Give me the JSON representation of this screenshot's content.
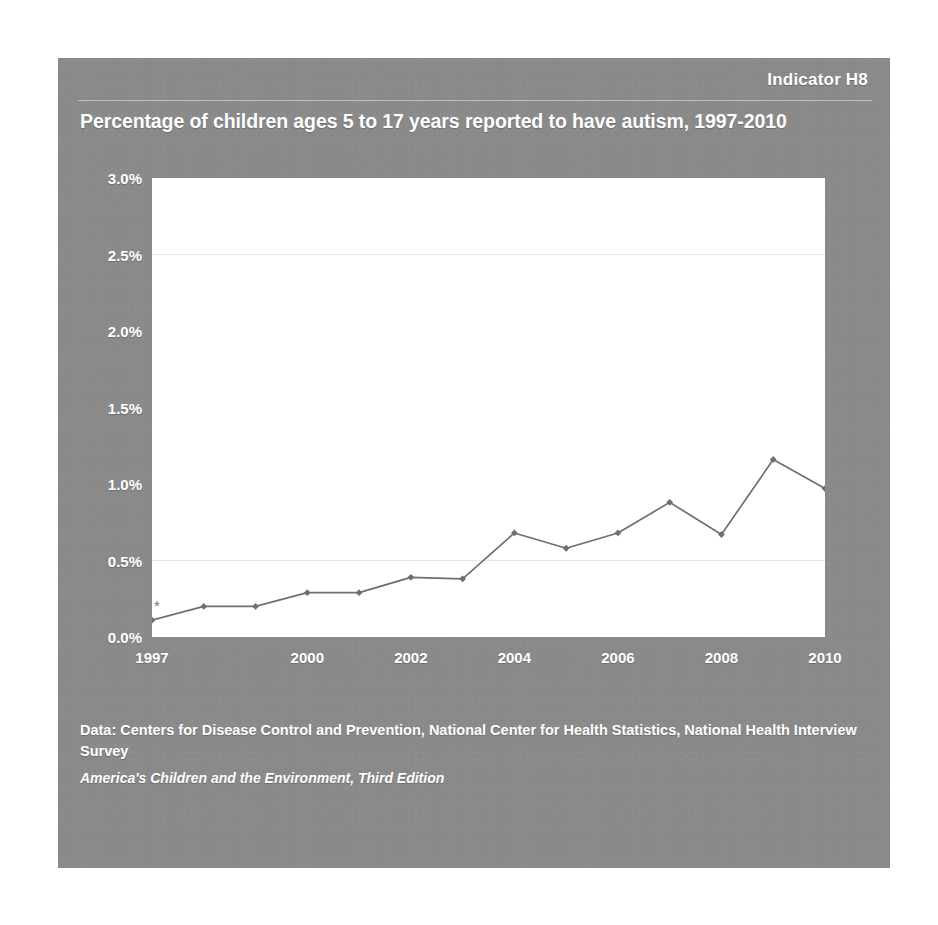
{
  "card": {
    "indicator_label": "Indicator H8",
    "background_color": "#8a8a8a",
    "text_color": "#ffffff"
  },
  "footer": {
    "source_line": "Data: Centers for Disease Control and Prevention, National Center for Health Statistics, National Health Interview Survey",
    "publication": "America's Children and the Environment, Third Edition"
  },
  "chart_data": {
    "type": "line",
    "title": "Percentage of children ages 5 to 17 years reported to have autism, 1997-2010",
    "xlabel": "",
    "ylabel": "",
    "x": [
      1997,
      1998,
      1999,
      2000,
      2001,
      2002,
      2003,
      2004,
      2005,
      2006,
      2007,
      2008,
      2009,
      2010
    ],
    "values": [
      0.11,
      0.2,
      0.2,
      0.29,
      0.29,
      0.39,
      0.38,
      0.68,
      0.58,
      0.68,
      0.88,
      0.67,
      1.16,
      0.97
    ],
    "series": [
      {
        "name": "Percentage of children ages 5 to 17 years reported to have autism",
        "values": [
          0.11,
          0.2,
          0.2,
          0.29,
          0.29,
          0.39,
          0.38,
          0.68,
          0.58,
          0.68,
          0.88,
          0.67,
          1.16,
          0.97
        ]
      }
    ],
    "xlim": [
      1997,
      2010
    ],
    "ylim": [
      0.0,
      3.0
    ],
    "ytick_values": [
      0.0,
      0.5,
      1.0,
      1.5,
      2.0,
      2.5,
      3.0
    ],
    "ytick_labels": [
      "0.0%",
      "0.5%",
      "1.0%",
      "1.5%",
      "2.0%",
      "2.5%",
      "3.0%"
    ],
    "xtick_values": [
      1997,
      2000,
      2002,
      2004,
      2006,
      2008,
      2010
    ],
    "xtick_labels": [
      "1997",
      "2000",
      "2002",
      "2004",
      "2006",
      "2008",
      "2010"
    ],
    "grid": true,
    "gridline_values": [
      0.5,
      2.5
    ],
    "legend": "none",
    "line_color": "#6f6f6f",
    "marker": "diamond",
    "plot_background": "#ffffff",
    "annotations": [
      {
        "text": "*",
        "x": 1997,
        "y": 0.11,
        "note": "asterisk marker above 1997 data point"
      }
    ]
  }
}
